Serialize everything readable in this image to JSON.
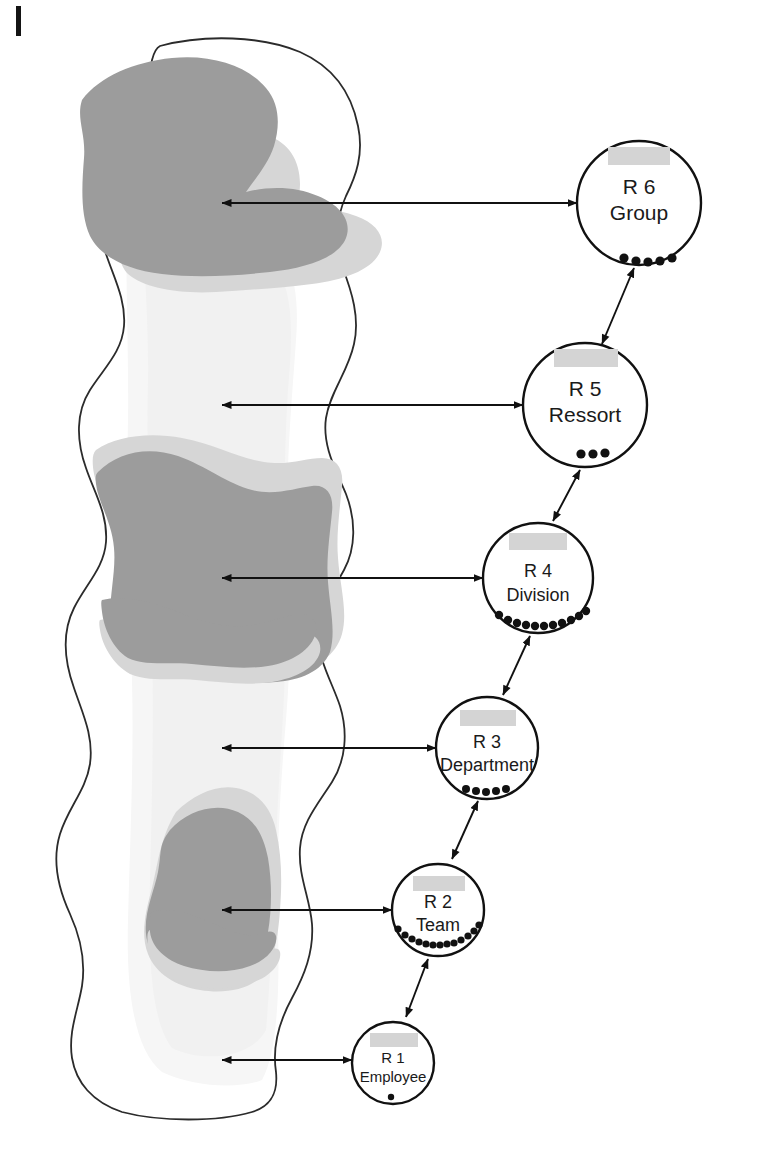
{
  "figure": {
    "margin_mark": "|",
    "nodes": [
      {
        "id": "r6",
        "code": "R 6",
        "name": "Group",
        "redacted": true,
        "dots": 5,
        "cx": 639,
        "cy": 203,
        "r": 62
      },
      {
        "id": "r5",
        "code": "R 5",
        "name": "Ressort",
        "redacted": true,
        "dots": 3,
        "cx": 585,
        "cy": 405,
        "r": 62
      },
      {
        "id": "r4",
        "code": "R 4",
        "name": "Division",
        "redacted": true,
        "dots": 11,
        "cx": 538,
        "cy": 578,
        "r": 55
      },
      {
        "id": "r3",
        "code": "R 3",
        "name": "Department",
        "redacted": true,
        "dots": 5,
        "cx": 487,
        "cy": 748,
        "r": 51
      },
      {
        "id": "r2",
        "code": "R 2",
        "name": "Team",
        "redacted": true,
        "dots": 13,
        "cx": 438,
        "cy": 910,
        "r": 46
      },
      {
        "id": "r1",
        "code": "R 1",
        "name": "Employee",
        "redacted": true,
        "dots": 1,
        "cx": 393,
        "cy": 1063,
        "r": 41
      }
    ],
    "horizontal_connectors": [
      {
        "id": "conn-r6",
        "y": 203,
        "x_left": 222,
        "x_right": 577,
        "arrow_both_ends": true
      },
      {
        "id": "conn-r5",
        "y": 405,
        "x_left": 222,
        "x_right": 523,
        "arrow_both_ends": true
      },
      {
        "id": "conn-r4",
        "y": 578,
        "x_left": 222,
        "x_right": 483,
        "arrow_both_ends": true
      },
      {
        "id": "conn-r3",
        "y": 748,
        "x_left": 222,
        "x_right": 436,
        "arrow_both_ends": true
      },
      {
        "id": "conn-r2",
        "y": 910,
        "x_left": 222,
        "x_right": 392,
        "arrow_both_ends": true
      },
      {
        "id": "conn-r1",
        "y": 1060,
        "x_left": 222,
        "x_right": 352,
        "arrow_both_ends": true
      }
    ],
    "diagonal_connectors": [
      {
        "id": "link-r5-r6",
        "from": "r5",
        "to": "r6",
        "arrow_both_ends": true
      },
      {
        "id": "link-r4-r5",
        "from": "r4",
        "to": "r5",
        "arrow_both_ends": true
      },
      {
        "id": "link-r3-r4",
        "from": "r3",
        "to": "r4",
        "arrow_both_ends": true
      },
      {
        "id": "link-r2-r3",
        "from": "r2",
        "to": "r3",
        "arrow_both_ends": true
      },
      {
        "id": "link-r1-r2",
        "from": "r1",
        "to": "r2",
        "arrow_both_ends": true
      }
    ],
    "blob": {
      "name": "organizational-scope-blob",
      "outline_color": "#2b2b2b",
      "pale_fill": "#f4f4f4",
      "mid_fill": "#d8d8d8",
      "dark_fill": "#9a9a9a"
    },
    "colors": {
      "ink": "#1a1a1a",
      "redaction": "#d4d4d4",
      "circle_stroke": "#111111"
    }
  }
}
